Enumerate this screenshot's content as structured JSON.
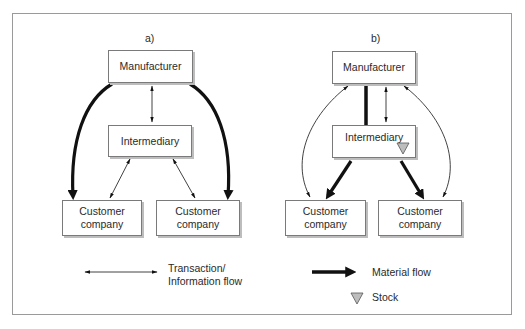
{
  "panels": {
    "a": {
      "label": "a)",
      "manufacturer": "Manufacturer",
      "intermediary": "Intermediary",
      "customer_left": "Customer company",
      "customer_right": "Customer company"
    },
    "b": {
      "label": "b)",
      "manufacturer": "Manufacturer",
      "intermediary": "Intermediary",
      "customer_left": "Customer company",
      "customer_right": "Customer company"
    }
  },
  "legend": {
    "transaction": "Transaction/ Information flow",
    "transaction_line1": "Transaction/",
    "transaction_line2": "Information flow",
    "material": "Material flow",
    "stock": "Stock"
  },
  "colors": {
    "stroke": "#111111",
    "stock_fill": "#bdbdbd",
    "border": "#9a9a9a"
  }
}
